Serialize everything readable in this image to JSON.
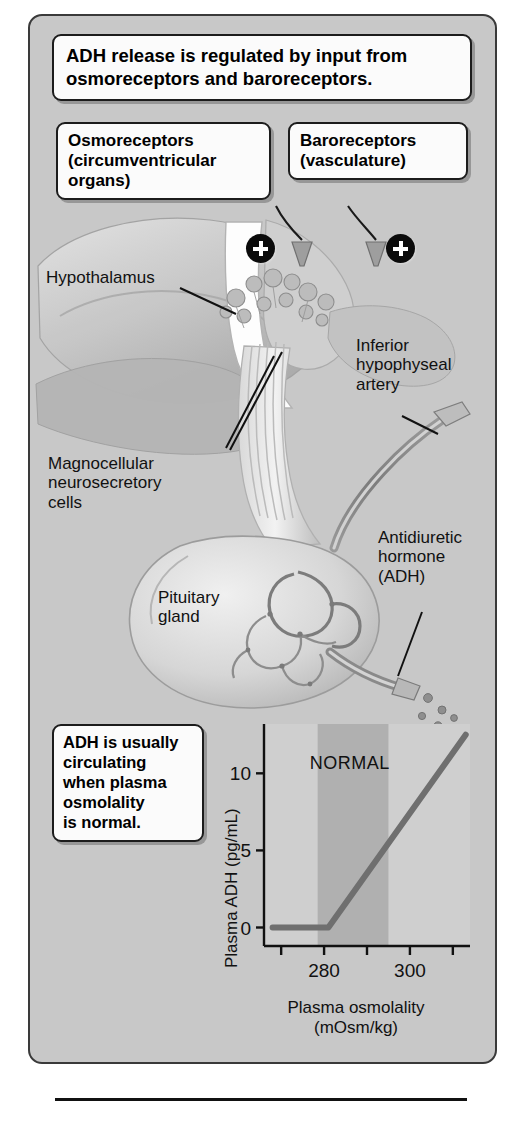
{
  "title_callout": {
    "line1": "ADH release is regulated by input from",
    "line2": "osmoreceptors and baroreceptors."
  },
  "receptor_callouts": [
    {
      "name": "osmoreceptors",
      "line1": "Osmoreceptors",
      "line2": "(circumventricular",
      "line3": "organs)"
    },
    {
      "name": "baroreceptors",
      "line1": "Baroreceptors",
      "line2": "(vasculature)",
      "line3": ""
    }
  ],
  "signal_badges": [
    {
      "symbol": "+",
      "meaning": "stimulatory-input-left"
    },
    {
      "symbol": "+",
      "meaning": "stimulatory-input-right"
    }
  ],
  "anatomy_labels": [
    {
      "name": "hypothalamus",
      "line1": "Hypothalamus",
      "line2": "",
      "line3": ""
    },
    {
      "name": "magnocellular-neurosecretory-cells",
      "line1": "Magnocellular",
      "line2": "neurosecretory",
      "line3": "cells"
    },
    {
      "name": "inferior-hypophyseal-artery",
      "line1": "Inferior",
      "line2": "hypophyseal",
      "line3": "artery"
    },
    {
      "name": "pituitary-gland",
      "line1": "Pituitary",
      "line2": "gland",
      "line3": ""
    },
    {
      "name": "antidiuretic-hormone",
      "line1": "Antidiuretic",
      "line2": "hormone",
      "line3": "(ADH)"
    }
  ],
  "bottom_callout": {
    "line1": "ADH is usually",
    "line2": "circulating",
    "line3": "when plasma",
    "line4": "osmolality",
    "line5": "is normal."
  },
  "chart_data": {
    "type": "line",
    "title": "",
    "xlabel": "Plasma osmolality",
    "xlabel_units": "(mOsm/kg)",
    "ylabel": "Plasma ADH (pg/mL)",
    "xlim": [
      266,
      314
    ],
    "ylim": [
      -1.2,
      13.2
    ],
    "xticks": [
      270,
      280,
      290,
      300,
      310
    ],
    "xticklabels": [
      "",
      "280",
      "",
      "300",
      ""
    ],
    "yticks": [
      0,
      5,
      10
    ],
    "yticklabels": [
      "0",
      "5",
      "10"
    ],
    "grid": false,
    "legend": "none",
    "series": [
      {
        "name": "Plasma ADH response",
        "color": "#6f6f6f",
        "x": [
          268,
          281,
          313
        ],
        "y": [
          0,
          0,
          12.5
        ]
      }
    ],
    "shaded_regions": [
      {
        "label": "NORMAL",
        "x_start": 278.5,
        "x_end": 295,
        "color": "#b0b0b0"
      }
    ],
    "annotations": [
      {
        "text": "NORMAL",
        "x": 286,
        "y": 10.3
      }
    ]
  },
  "colors": {
    "panel_background": "#c8c8c8",
    "callout_background": "#fbfbfb",
    "ink": "#111111",
    "curve": "#6f6f6f",
    "normal_band": "#b0b0b0",
    "plot_background": "#cfcfcf"
  }
}
